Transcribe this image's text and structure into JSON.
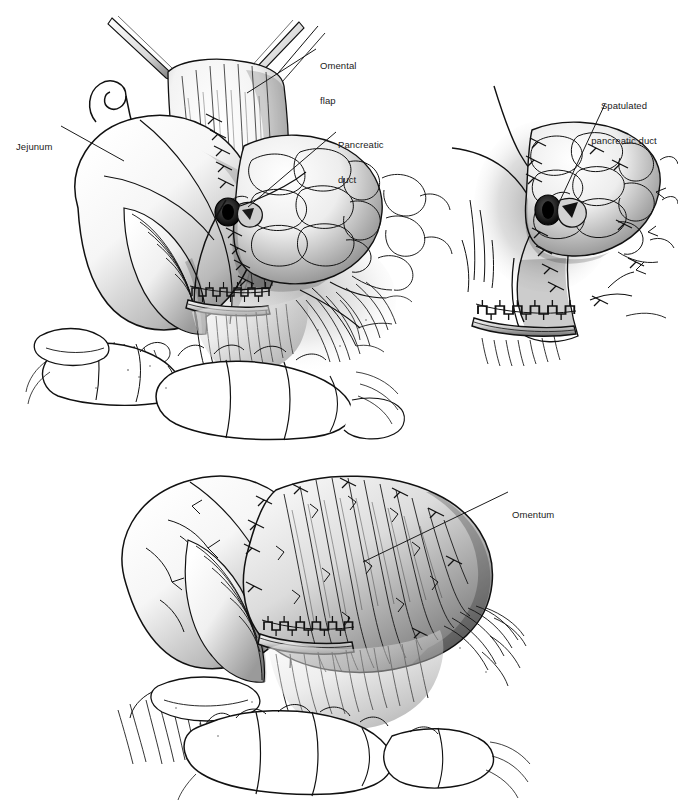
{
  "figure": {
    "kind": "medical-surgical-illustration",
    "background_color": "#ffffff",
    "ink_color": "#111111",
    "style": "pen-and-ink line art with airbrush tonal shading",
    "panel_count": 3
  },
  "panels": [
    {
      "id": "panel-a",
      "name": "upper-left-panel",
      "description": "Pancreaticojejunal anastomosis with omental flap elevated by forceps, jejunal limb and stapled transection line",
      "bounds": {
        "x": 20,
        "y": 14,
        "width": 400,
        "height": 430
      }
    },
    {
      "id": "panel-b",
      "name": "upper-right-panel",
      "description": "Close-up of spatulated pancreatic duct anastomosis with interrupted sutures and staple line",
      "bounds": {
        "x": 440,
        "y": 70,
        "width": 238,
        "height": 290
      }
    },
    {
      "id": "panel-c",
      "name": "lower-panel",
      "description": "Completed omentum wrap over the anastomosis overlying transverse colon",
      "bounds": {
        "x": 60,
        "y": 455,
        "width": 560,
        "height": 330
      }
    }
  ],
  "labels": [
    {
      "id": "label-omental-flap",
      "name": "omental-flap-label",
      "text": "Omental\nflap",
      "lines": [
        "Omental",
        "flap"
      ],
      "align": "left",
      "x": 320,
      "y": 38,
      "leader": {
        "from": [
          316,
          49
        ],
        "to": [
          247,
          93
        ]
      }
    },
    {
      "id": "label-pancreatic-duct",
      "name": "pancreatic-duct-label",
      "text": "Pancreatic\nduct",
      "lines": [
        "Pancreatic",
        "duct"
      ],
      "align": "left",
      "x": 338,
      "y": 117,
      "leader": {
        "from": [
          336,
          132
        ],
        "to": [
          248,
          207
        ]
      }
    },
    {
      "id": "label-jejunum",
      "name": "jejunum-label",
      "text": "Jejunum",
      "lines": [
        "Jejunum"
      ],
      "align": "left",
      "x": 16,
      "y": 118,
      "leader": {
        "from": [
          61,
          126
        ],
        "to": [
          124,
          161
        ]
      }
    },
    {
      "id": "label-spatulated-pancreatic-duct",
      "name": "spatulated-pancreatic-duct-label",
      "text": "Spatulated\npancreatic duct",
      "lines": [
        "Spatulated",
        "pancreatic duct"
      ],
      "align": "center",
      "x": 583,
      "y": 78,
      "width": 82,
      "leader": {
        "from": [
          605,
          104
        ],
        "to": [
          558,
          205
        ]
      }
    },
    {
      "id": "label-omentum",
      "name": "omentum-label",
      "text": "Omentum",
      "lines": [
        "Omentum"
      ],
      "align": "left",
      "x": 512,
      "y": 486,
      "leader": {
        "from": [
          508,
          492
        ],
        "to": [
          363,
          562
        ]
      }
    }
  ],
  "anatomy_features": [
    {
      "name": "omental-flap",
      "panel": "panel-a"
    },
    {
      "name": "jejunal-loop",
      "panel": "panel-a"
    },
    {
      "name": "pancreas-body",
      "panel": "panel-a"
    },
    {
      "name": "pancreatic-duct-orifice",
      "panel": "panel-a"
    },
    {
      "name": "suture-line",
      "panel": "panel-a"
    },
    {
      "name": "stapled-transection-line",
      "panel": "panel-a"
    },
    {
      "name": "transverse-colon",
      "panel": "panel-a"
    },
    {
      "name": "forceps-tips",
      "panel": "panel-a"
    },
    {
      "name": "spatulated-duct",
      "panel": "panel-b"
    },
    {
      "name": "interrupted-sutures",
      "panel": "panel-b"
    },
    {
      "name": "stapled-transection-line",
      "panel": "panel-b"
    },
    {
      "name": "omentum-wrap",
      "panel": "panel-c"
    },
    {
      "name": "stapled-transection-line",
      "panel": "panel-c"
    },
    {
      "name": "transverse-colon",
      "panel": "panel-c"
    }
  ]
}
